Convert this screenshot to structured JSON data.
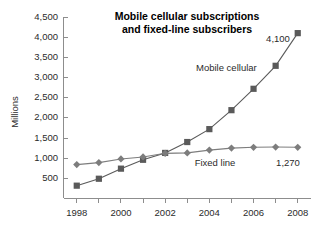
{
  "chart_data": {
    "type": "line",
    "title": "Mobile cellular subscriptions and fixed-line subscribers",
    "title_line1": "Mobile cellular subscriptions",
    "title_line2": "and fixed-line subscribers",
    "xlabel": "",
    "ylabel": "Millions",
    "x": [
      1998,
      1999,
      2000,
      2001,
      2002,
      2003,
      2004,
      2005,
      2006,
      2007,
      2008
    ],
    "xtick_labels": [
      "1998",
      "2000",
      "2002",
      "2004",
      "2006",
      "2008"
    ],
    "xtick_values": [
      1998,
      2000,
      2002,
      2004,
      2006,
      2008
    ],
    "xlim": [
      1997.4,
      2008.6
    ],
    "ylim": [
      0,
      4500
    ],
    "ytick_labels": [
      "500",
      "1,000",
      "1,500",
      "2,000",
      "2,500",
      "3,000",
      "3,500",
      "4,000",
      "4,500"
    ],
    "ytick_values": [
      500,
      1000,
      1500,
      2000,
      2500,
      3000,
      3500,
      4000,
      4500
    ],
    "grid": false,
    "legend_position": "inline-annotations",
    "series": [
      {
        "name": "Mobile cellular",
        "marker": "square",
        "color": "#5a5a5a",
        "label_text": "Mobile cellular",
        "end_value_label": "4,100",
        "values": [
          318,
          490,
          740,
          960,
          1130,
          1400,
          1720,
          2190,
          2720,
          3290,
          4100
        ]
      },
      {
        "name": "Fixed line",
        "marker": "diamond",
        "color": "#7d7d7d",
        "label_text": "Fixed line",
        "end_value_label": "1,270",
        "values": [
          840,
          890,
          980,
          1030,
          1120,
          1130,
          1200,
          1250,
          1270,
          1275,
          1270
        ]
      }
    ],
    "annotations": [
      {
        "text": "Mobile cellular",
        "series": "Mobile cellular"
      },
      {
        "text": "Fixed line",
        "series": "Fixed line"
      },
      {
        "text": "4,100",
        "series": "Mobile cellular"
      },
      {
        "text": "1,270",
        "series": "Fixed line"
      }
    ]
  },
  "colors": {
    "mobile": "#5a5a5a",
    "fixed": "#7d7d7d",
    "axis": "#8d8d8d",
    "text": "#2b2b2b",
    "background": "#ffffff"
  }
}
